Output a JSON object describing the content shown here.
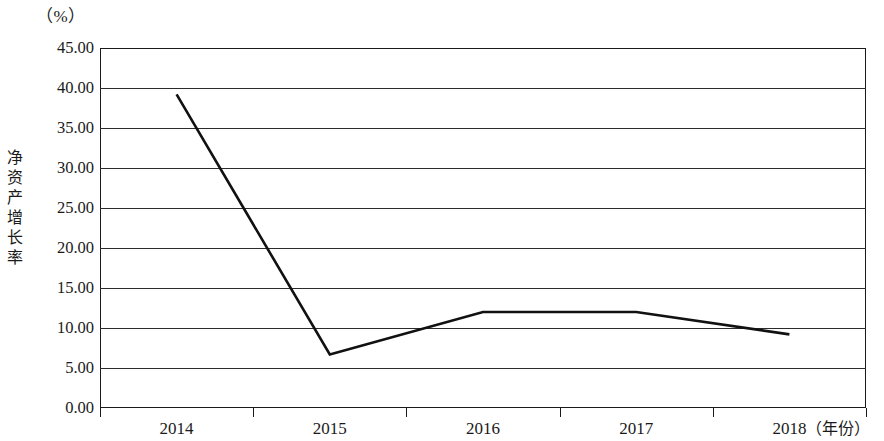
{
  "chart_data": {
    "type": "line",
    "title": "",
    "xlabel": "（年份）",
    "ylabel": "净资产增长率",
    "unit_label": "（%）",
    "categories": [
      "2014",
      "2015",
      "2016",
      "2017",
      "2018"
    ],
    "series": [
      {
        "name": "净资产增长率",
        "values": [
          39.2,
          6.7,
          12.0,
          12.0,
          9.2
        ]
      }
    ],
    "ylim": [
      0,
      45
    ],
    "ytick_step": 5,
    "ytick_labels": [
      "45.00",
      "40.00",
      "35.00",
      "30.00",
      "25.00",
      "20.00",
      "15.00",
      "10.00",
      "5.00",
      "0.00"
    ],
    "ytick_values": [
      45,
      40,
      35,
      30,
      25,
      20,
      15,
      10,
      5,
      0
    ],
    "grid": true,
    "legend": "none",
    "line_color": "#111111"
  }
}
